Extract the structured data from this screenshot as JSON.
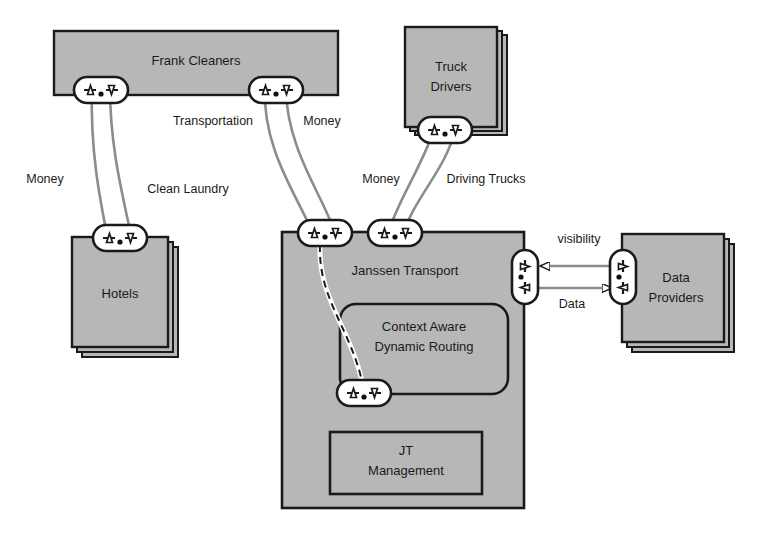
{
  "diagram": {
    "type": "e3value / value-network diagram",
    "colors": {
      "actor_fill": "#b7b7b7",
      "actor_stroke": "#1a1a1a",
      "port_fill": "#ffffff",
      "port_stroke": "#1a1a1a",
      "connector_stroke": "#8c8c8c",
      "text": "#1a1a1a",
      "background": "#ffffff"
    },
    "actors": [
      {
        "id": "frank-cleaners",
        "label": "Frank Cleaners",
        "stacked": false,
        "shape": "rect"
      },
      {
        "id": "truck-drivers",
        "label_line1": "Truck",
        "label_line2": "Drivers",
        "label": "Truck Drivers",
        "stacked": true,
        "shape": "rect"
      },
      {
        "id": "hotels",
        "label": "Hotels",
        "stacked": true,
        "shape": "rect"
      },
      {
        "id": "janssen-transport",
        "label": "Janssen Transport",
        "stacked": false,
        "shape": "rect"
      },
      {
        "id": "data-providers",
        "label_line1": "Data",
        "label_line2": "Providers",
        "label": "Data Providers",
        "stacked": true,
        "shape": "rect"
      }
    ],
    "sub_actors": [
      {
        "id": "context-aware-dynamic-routing",
        "label_line1": "Context Aware",
        "label_line2": "Dynamic Routing",
        "label": "Context Aware Dynamic Routing",
        "parent": "janssen-transport",
        "shape": "rounded-rect"
      },
      {
        "id": "jt-management",
        "label_line1": "JT",
        "label_line2": "Management",
        "label": "JT Management",
        "parent": "janssen-transport",
        "shape": "rect"
      }
    ],
    "value_exchanges": [
      {
        "id": "money-hotels-frank",
        "label": "Money",
        "from": "hotels",
        "to": "frank-cleaners"
      },
      {
        "id": "clean-laundry-frank-hotels",
        "label": "Clean Laundry",
        "from": "frank-cleaners",
        "to": "hotels"
      },
      {
        "id": "transportation-janssen-frank",
        "label": "Transportation",
        "from": "janssen-transport",
        "to": "frank-cleaners"
      },
      {
        "id": "money-frank-janssen",
        "label": "Money",
        "from": "frank-cleaners",
        "to": "janssen-transport"
      },
      {
        "id": "money-janssen-drivers",
        "label": "Money",
        "from": "janssen-transport",
        "to": "truck-drivers"
      },
      {
        "id": "driving-trucks-drivers-janssen",
        "label": "Driving Trucks",
        "from": "truck-drivers",
        "to": "janssen-transport"
      },
      {
        "id": "visibility-providers-janssen",
        "label": "visibility",
        "from": "data-providers",
        "to": "janssen-transport"
      },
      {
        "id": "data-janssen-providers",
        "label": "Data",
        "from": "janssen-transport",
        "to": "data-providers"
      }
    ],
    "ports": [
      {
        "id": "port-frank-left",
        "owner": "frank-cleaners",
        "orientation": "horizontal",
        "in_marker": "triangle-up",
        "out_marker": "triangle-down"
      },
      {
        "id": "port-frank-right",
        "owner": "frank-cleaners",
        "orientation": "horizontal",
        "in_marker": "triangle-up",
        "out_marker": "triangle-down"
      },
      {
        "id": "port-hotels-top",
        "owner": "hotels",
        "orientation": "horizontal",
        "in_marker": "triangle-up",
        "out_marker": "triangle-down"
      },
      {
        "id": "port-drivers-bottom",
        "owner": "truck-drivers",
        "orientation": "horizontal",
        "in_marker": "triangle-up",
        "out_marker": "triangle-down"
      },
      {
        "id": "port-janssen-top-left",
        "owner": "janssen-transport",
        "orientation": "horizontal",
        "in_marker": "triangle-up",
        "out_marker": "triangle-down"
      },
      {
        "id": "port-janssen-top-right",
        "owner": "janssen-transport",
        "orientation": "horizontal",
        "in_marker": "triangle-up",
        "out_marker": "triangle-down"
      },
      {
        "id": "port-janssen-right",
        "owner": "janssen-transport",
        "orientation": "vertical",
        "in_marker": "triangle-right",
        "out_marker": "triangle-left"
      },
      {
        "id": "port-providers-left",
        "owner": "data-providers",
        "orientation": "vertical",
        "in_marker": "triangle-right",
        "out_marker": "triangle-left"
      },
      {
        "id": "port-routing-bottom",
        "owner": "context-aware-dynamic-routing",
        "orientation": "horizontal",
        "in_marker": "triangle-up",
        "out_marker": "triangle-down"
      }
    ],
    "internal_dependency_path": {
      "id": "dependency-path-janssen",
      "style": "dashed",
      "from_port": "port-janssen-top-left",
      "to_port": "port-routing-bottom"
    }
  }
}
